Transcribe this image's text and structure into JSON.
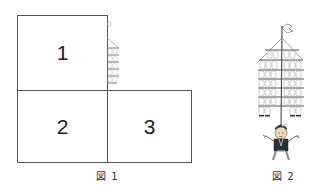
{
  "figure1": {
    "boxes": [
      {
        "label": "1"
      },
      {
        "label": "2"
      },
      {
        "label": "3"
      }
    ],
    "caption": "図 1",
    "illustration": "kanto-lantern-pole-edge-icon"
  },
  "figure2": {
    "caption": "図 2",
    "illustration": "kanto-festival-performer-icon"
  }
}
